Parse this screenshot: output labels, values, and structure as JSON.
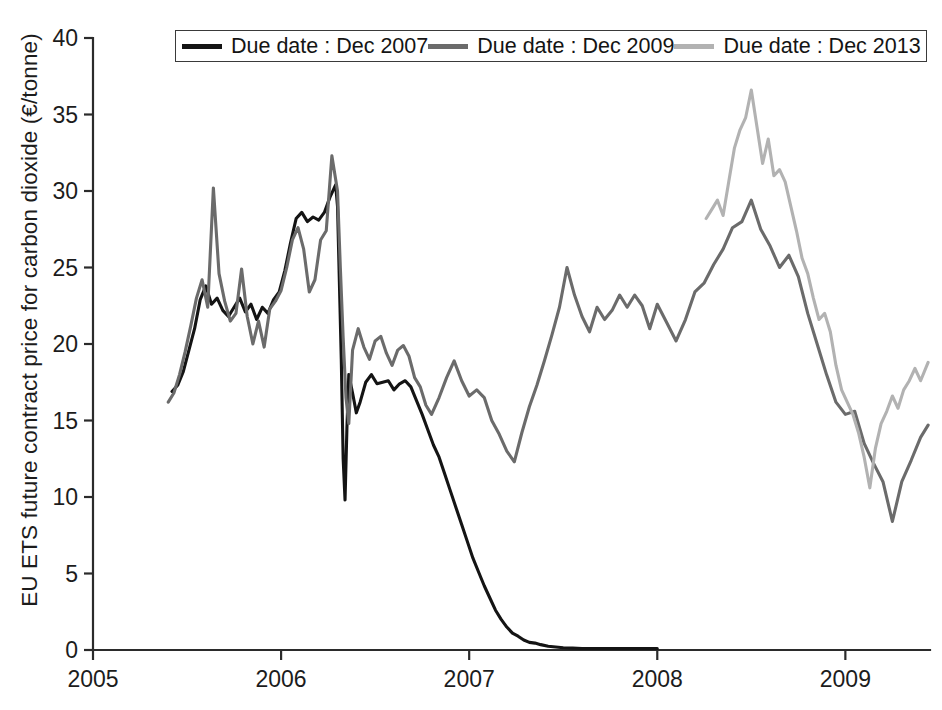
{
  "chart_data": {
    "type": "line",
    "title": "",
    "xlabel": "",
    "ylabel": "EU ETS future contract price for carbon dioxide  (€/tonne)",
    "xlim": [
      2005.0,
      2009.45
    ],
    "ylim": [
      0,
      40
    ],
    "grid": false,
    "legend_position": "top-center",
    "x_ticks": [
      "2005",
      "2006",
      "2007",
      "2008",
      "2009"
    ],
    "x_tick_values": [
      2005,
      2006,
      2007,
      2008,
      2009
    ],
    "y_ticks": [
      "0",
      "5",
      "10",
      "15",
      "20",
      "25",
      "30",
      "35",
      "40"
    ],
    "y_tick_values": [
      0,
      5,
      10,
      15,
      20,
      25,
      30,
      35,
      40
    ],
    "colors": {
      "dec_2007": "#141414",
      "dec_2009": "#6b6b6b",
      "dec_2013": "#b2b2b2",
      "axis": "#2b2b2b",
      "background": "#ffffff"
    },
    "series": [
      {
        "name": "Due date : Dec 2007",
        "color": "#141414",
        "x": [
          2005.42,
          2005.45,
          2005.48,
          2005.51,
          2005.54,
          2005.57,
          2005.6,
          2005.63,
          2005.66,
          2005.69,
          2005.72,
          2005.75,
          2005.78,
          2005.81,
          2005.84,
          2005.87,
          2005.9,
          2005.93,
          2005.96,
          2005.99,
          2006.02,
          2006.05,
          2006.08,
          2006.11,
          2006.14,
          2006.17,
          2006.2,
          2006.23,
          2006.26,
          2006.29,
          2006.3,
          2006.31,
          2006.32,
          2006.33,
          2006.34,
          2006.35,
          2006.36,
          2006.38,
          2006.4,
          2006.42,
          2006.45,
          2006.48,
          2006.51,
          2006.54,
          2006.57,
          2006.6,
          2006.63,
          2006.66,
          2006.69,
          2006.72,
          2006.75,
          2006.78,
          2006.81,
          2006.84,
          2006.87,
          2006.9,
          2006.93,
          2006.96,
          2006.99,
          2007.02,
          2007.05,
          2007.08,
          2007.11,
          2007.14,
          2007.17,
          2007.2,
          2007.23,
          2007.26,
          2007.29,
          2007.32,
          2007.35,
          2007.38,
          2007.42,
          2007.46,
          2007.5,
          2007.55,
          2007.6,
          2007.7,
          2007.8,
          2007.9,
          2008.0
        ],
        "y": [
          16.9,
          17.3,
          18.2,
          19.6,
          21.0,
          22.9,
          23.8,
          22.6,
          23.0,
          22.2,
          21.8,
          22.4,
          23.0,
          22.1,
          22.6,
          21.6,
          22.4,
          22.0,
          22.9,
          23.4,
          24.8,
          26.6,
          28.2,
          28.6,
          28.0,
          28.3,
          28.1,
          28.6,
          29.6,
          30.4,
          29.0,
          24.0,
          19.0,
          12.5,
          9.8,
          14.5,
          18.0,
          16.8,
          15.5,
          16.2,
          17.5,
          18.0,
          17.4,
          17.5,
          17.6,
          17.0,
          17.4,
          17.6,
          17.2,
          16.3,
          15.4,
          14.4,
          13.4,
          12.6,
          11.5,
          10.4,
          9.3,
          8.2,
          7.1,
          6.0,
          5.1,
          4.2,
          3.4,
          2.6,
          2.0,
          1.5,
          1.1,
          0.9,
          0.65,
          0.5,
          0.45,
          0.35,
          0.25,
          0.2,
          0.15,
          0.12,
          0.1,
          0.1,
          0.1,
          0.1,
          0.1
        ]
      },
      {
        "name": "Due date : Dec 2009",
        "color": "#6b6b6b",
        "x": [
          2005.4,
          2005.43,
          2005.46,
          2005.49,
          2005.52,
          2005.55,
          2005.58,
          2005.61,
          2005.64,
          2005.67,
          2005.7,
          2005.73,
          2005.76,
          2005.79,
          2005.82,
          2005.85,
          2005.88,
          2005.91,
          2005.94,
          2005.97,
          2006.0,
          2006.03,
          2006.06,
          2006.09,
          2006.12,
          2006.15,
          2006.18,
          2006.21,
          2006.24,
          2006.27,
          2006.3,
          2006.315,
          2006.33,
          2006.345,
          2006.36,
          2006.38,
          2006.41,
          2006.44,
          2006.47,
          2006.5,
          2006.53,
          2006.56,
          2006.59,
          2006.62,
          2006.65,
          2006.68,
          2006.71,
          2006.74,
          2006.77,
          2006.8,
          2006.84,
          2006.88,
          2006.92,
          2006.96,
          2007.0,
          2007.04,
          2007.08,
          2007.12,
          2007.16,
          2007.2,
          2007.24,
          2007.28,
          2007.32,
          2007.36,
          2007.4,
          2007.44,
          2007.48,
          2007.52,
          2007.56,
          2007.6,
          2007.64,
          2007.68,
          2007.72,
          2007.76,
          2007.8,
          2007.84,
          2007.88,
          2007.92,
          2007.96,
          2008.0,
          2008.05,
          2008.1,
          2008.15,
          2008.2,
          2008.25,
          2008.3,
          2008.35,
          2008.4,
          2008.45,
          2008.5,
          2008.55,
          2008.6,
          2008.65,
          2008.7,
          2008.75,
          2008.8,
          2008.85,
          2008.9,
          2008.95,
          2009.0,
          2009.05,
          2009.1,
          2009.15,
          2009.2,
          2009.25,
          2009.3,
          2009.35,
          2009.4,
          2009.44
        ],
        "y": [
          16.2,
          16.8,
          18.0,
          19.5,
          21.2,
          23.0,
          24.2,
          22.4,
          30.2,
          24.6,
          22.8,
          21.5,
          22.0,
          24.9,
          21.8,
          20.0,
          21.5,
          19.8,
          22.3,
          22.8,
          23.5,
          25.0,
          26.8,
          27.6,
          26.2,
          23.4,
          24.2,
          26.8,
          27.4,
          32.3,
          30.0,
          25.0,
          20.4,
          16.5,
          14.8,
          19.6,
          21.0,
          19.8,
          19.0,
          20.2,
          20.5,
          19.4,
          18.6,
          19.6,
          19.9,
          19.2,
          17.8,
          17.2,
          16.0,
          15.4,
          16.5,
          17.8,
          18.9,
          17.6,
          16.6,
          17.0,
          16.5,
          15.0,
          14.1,
          13.0,
          12.3,
          14.2,
          15.9,
          17.3,
          18.9,
          20.6,
          22.4,
          25.0,
          23.2,
          21.8,
          20.8,
          22.4,
          21.6,
          22.2,
          23.2,
          22.4,
          23.2,
          22.5,
          21.0,
          22.6,
          21.4,
          20.2,
          21.6,
          23.4,
          24.0,
          25.2,
          26.2,
          27.6,
          28.0,
          29.4,
          27.5,
          26.4,
          25.0,
          25.8,
          24.4,
          22.0,
          20.0,
          18.0,
          16.2,
          15.4,
          15.6,
          13.5,
          12.2,
          11.0,
          8.4,
          11.0,
          12.4,
          13.9,
          14.7
        ]
      },
      {
        "name": "Due date : Dec 2013",
        "color": "#b2b2b2",
        "x": [
          2008.26,
          2008.29,
          2008.32,
          2008.35,
          2008.38,
          2008.41,
          2008.44,
          2008.47,
          2008.5,
          2008.53,
          2008.56,
          2008.59,
          2008.62,
          2008.65,
          2008.68,
          2008.71,
          2008.74,
          2008.77,
          2008.8,
          2008.83,
          2008.86,
          2008.89,
          2008.92,
          2008.95,
          2008.98,
          2009.01,
          2009.04,
          2009.07,
          2009.1,
          2009.13,
          2009.16,
          2009.19,
          2009.22,
          2009.25,
          2009.28,
          2009.31,
          2009.34,
          2009.37,
          2009.4,
          2009.44
        ],
        "y": [
          28.2,
          28.8,
          29.4,
          28.4,
          30.6,
          32.8,
          34.0,
          34.8,
          36.6,
          34.2,
          31.8,
          33.4,
          31.0,
          31.4,
          30.6,
          29.0,
          27.4,
          25.6,
          24.6,
          23.0,
          21.6,
          22.0,
          20.8,
          18.6,
          17.0,
          16.2,
          15.4,
          14.2,
          12.6,
          10.6,
          13.2,
          14.8,
          15.6,
          16.6,
          15.8,
          17.0,
          17.6,
          18.4,
          17.6,
          18.8
        ]
      }
    ]
  },
  "legend": {
    "items": [
      {
        "label": "Due date : Dec 2007",
        "color": "#141414"
      },
      {
        "label": "Due date : Dec 2009",
        "color": "#6b6b6b"
      },
      {
        "label": "Due date : Dec 2013",
        "color": "#b2b2b2"
      }
    ]
  }
}
